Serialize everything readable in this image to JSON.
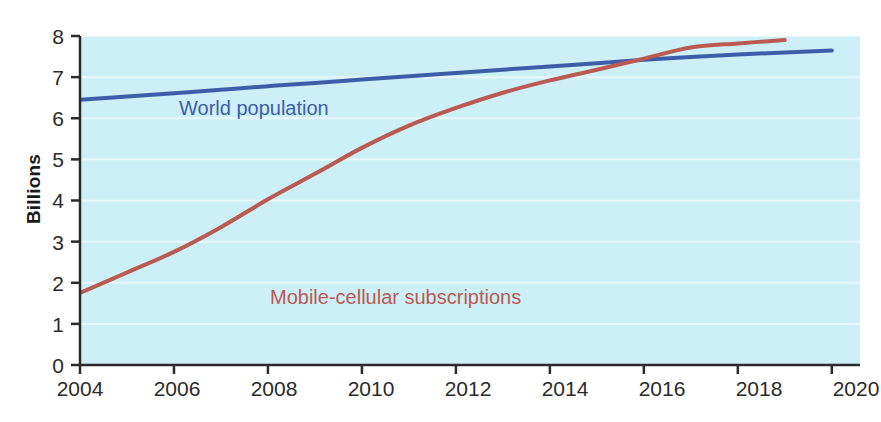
{
  "chart_data": {
    "type": "line",
    "title": "",
    "xlabel": "",
    "ylabel": "Billions",
    "xlim": [
      2004,
      2020.6
    ],
    "ylim": [
      0,
      8
    ],
    "grid": true,
    "grid_color": "#e8f7fb",
    "plot_background": "#cdeff7",
    "legend_position": "inline-annotations",
    "x_ticks": [
      "2004",
      "2006",
      "2008",
      "2010",
      "2012",
      "2014",
      "2016",
      "2018",
      "2020"
    ],
    "x_tick_values": [
      2004,
      2006,
      2008,
      2010,
      2012,
      2014,
      2016,
      2018,
      2020
    ],
    "y_ticks": [
      "0",
      "1",
      "2",
      "3",
      "4",
      "5",
      "6",
      "7",
      "8"
    ],
    "y_tick_values": [
      0,
      1,
      2,
      3,
      4,
      5,
      6,
      7,
      8
    ],
    "series": [
      {
        "name": "World population",
        "color": "#3c5ea8",
        "x": [
          2004,
          2005,
          2006,
          2007,
          2008,
          2009,
          2010,
          2011,
          2012,
          2013,
          2014,
          2015,
          2016,
          2017,
          2018,
          2019,
          2020
        ],
        "values": [
          6.45,
          6.53,
          6.61,
          6.69,
          6.78,
          6.86,
          6.94,
          7.02,
          7.1,
          7.18,
          7.26,
          7.34,
          7.42,
          7.49,
          7.55,
          7.6,
          7.65
        ]
      },
      {
        "name": "Mobile-cellular subscriptions",
        "color": "#bb5a50",
        "x": [
          2004,
          2005,
          2006,
          2007,
          2008,
          2009,
          2010,
          2011,
          2012,
          2013,
          2014,
          2015,
          2016,
          2017,
          2018,
          2019
        ],
        "values": [
          1.75,
          2.25,
          2.75,
          3.35,
          4.03,
          4.65,
          5.28,
          5.82,
          6.25,
          6.62,
          6.92,
          7.18,
          7.45,
          7.72,
          7.82,
          7.9
        ]
      }
    ],
    "annotations": [
      {
        "text": "World population",
        "color": "#3c5ea8"
      },
      {
        "text": "Mobile-cellular subscriptions",
        "color": "#bb5a50"
      }
    ]
  },
  "axis": {
    "y_title": "Billions"
  }
}
